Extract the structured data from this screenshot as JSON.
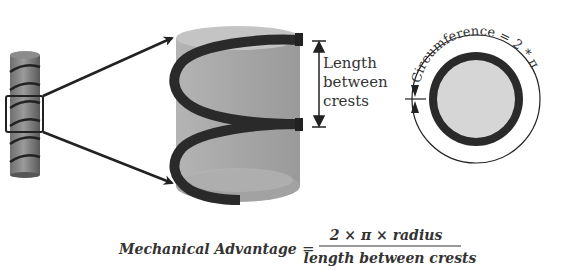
{
  "diagram": {
    "screw_label": "Length between crests",
    "screw_label_lines": [
      "Length",
      "between",
      "crests"
    ],
    "circle_label": "Circumference = 2 * π * radius",
    "formula": {
      "lhs": "Mechanical Advantage",
      "equals": "=",
      "numerator": "2 × π × radius",
      "denominator": "length between crests"
    },
    "colors": {
      "cylinder": "#a8a8a8",
      "cylinder_dark": "#8a8a8a",
      "thread": "#2a2a2a",
      "inner_disc": "#d6d6d6",
      "line": "#222222"
    }
  }
}
